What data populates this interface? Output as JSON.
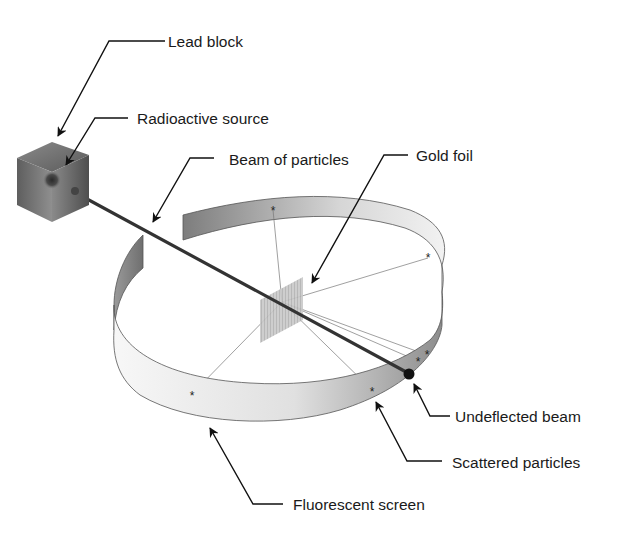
{
  "diagram": {
    "labels": {
      "lead_block": "Lead block",
      "radioactive_source": "Radioactive source",
      "beam_of_particles": "Beam of particles",
      "gold_foil": "Gold foil",
      "undeflected_beam": "Undeflected beam",
      "scattered_particles": "Scattered particles",
      "fluorescent_screen": "Fluorescent screen"
    },
    "colors": {
      "background": "#ffffff",
      "line": "#1a1a1a",
      "screen_light": "#f4f4f4",
      "screen_dark": "#8a8a8a",
      "foil": "#bdbdbd",
      "beam": "#3a3a3a"
    }
  }
}
